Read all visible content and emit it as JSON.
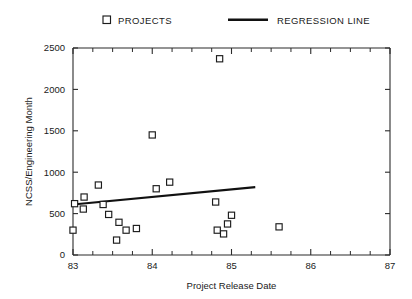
{
  "chart_data": {
    "type": "scatter",
    "title": "",
    "xlabel": "Project Release Date",
    "ylabel": "NCSS/Engineering Month",
    "xlim": [
      83,
      87
    ],
    "ylim": [
      0,
      2500
    ],
    "xticks": [
      83,
      84,
      85,
      86,
      87
    ],
    "xtick_labels": [
      "83",
      "84",
      "85",
      "86",
      "87"
    ],
    "yticks": [
      0,
      500,
      1000,
      1500,
      2000,
      2500
    ],
    "ytick_labels": [
      "0",
      "500",
      "1000",
      "1500",
      "2000",
      "2500"
    ],
    "minor_xticks_per_interval": 4,
    "grid": false,
    "legend_position": "above-plot",
    "legend": [
      {
        "label": "PROJECTS",
        "marker": "open-square",
        "color": "#1c1c1c"
      },
      {
        "label": "REGRESSION LINE",
        "marker": "line",
        "color": "#111111"
      }
    ],
    "series": [
      {
        "name": "PROJECTS",
        "marker": "open-square",
        "points": [
          {
            "x": 83.0,
            "y": 300
          },
          {
            "x": 83.02,
            "y": 620
          },
          {
            "x": 83.13,
            "y": 555
          },
          {
            "x": 83.14,
            "y": 700
          },
          {
            "x": 83.32,
            "y": 845
          },
          {
            "x": 83.38,
            "y": 610
          },
          {
            "x": 83.45,
            "y": 490
          },
          {
            "x": 83.55,
            "y": 180
          },
          {
            "x": 83.58,
            "y": 395
          },
          {
            "x": 83.67,
            "y": 300
          },
          {
            "x": 83.8,
            "y": 320
          },
          {
            "x": 84.0,
            "y": 1450
          },
          {
            "x": 84.05,
            "y": 800
          },
          {
            "x": 84.22,
            "y": 880
          },
          {
            "x": 84.85,
            "y": 2370
          },
          {
            "x": 84.8,
            "y": 640
          },
          {
            "x": 84.82,
            "y": 300
          },
          {
            "x": 84.9,
            "y": 255
          },
          {
            "x": 84.95,
            "y": 375
          },
          {
            "x": 85.0,
            "y": 480
          },
          {
            "x": 85.6,
            "y": 340
          }
        ]
      }
    ],
    "regression_line": {
      "name": "REGRESSION LINE",
      "x_start": 83.0,
      "y_start": 610,
      "x_end": 85.3,
      "y_end": 820
    }
  },
  "geometry": {
    "plot_left": 73,
    "plot_right": 390,
    "plot_top": 48,
    "plot_bottom": 255
  }
}
